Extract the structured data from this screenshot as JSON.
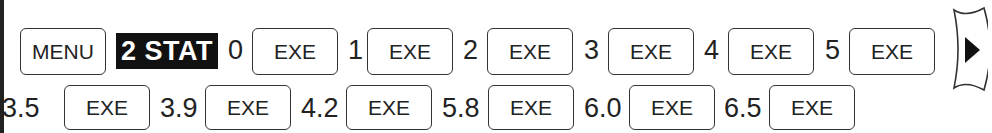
{
  "menu_label": "MENU",
  "mode_label": "2 STAT",
  "row1": [
    {
      "value": "0",
      "key": "EXE"
    },
    {
      "value": "1",
      "key": "EXE"
    },
    {
      "value": "2",
      "key": "EXE"
    },
    {
      "value": "3",
      "key": "EXE"
    },
    {
      "value": "4",
      "key": "EXE"
    },
    {
      "value": "5",
      "key": "EXE"
    }
  ],
  "row2": [
    {
      "value": "3.5",
      "key": "EXE"
    },
    {
      "value": "3.9",
      "key": "EXE"
    },
    {
      "value": "4.2",
      "key": "EXE"
    },
    {
      "value": "5.8",
      "key": "EXE"
    },
    {
      "value": "6.0",
      "key": "EXE"
    },
    {
      "value": "6.5",
      "key": "EXE"
    }
  ],
  "cursor_icon": "right-arrow-key-icon"
}
